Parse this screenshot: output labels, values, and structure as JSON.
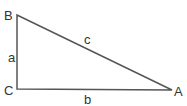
{
  "diagram": {
    "type": "right-triangle",
    "vertices": {
      "B": {
        "label": "B",
        "x": 17,
        "y": 15
      },
      "C": {
        "label": "C",
        "x": 17,
        "y": 89
      },
      "A": {
        "label": "A",
        "x": 172,
        "y": 90
      }
    },
    "sides": {
      "a": {
        "label": "a",
        "from": "B",
        "to": "C"
      },
      "b": {
        "label": "b",
        "from": "C",
        "to": "A"
      },
      "c": {
        "label": "c",
        "from": "B",
        "to": "A"
      }
    },
    "colors": {
      "line": "#555555",
      "text": "#333333",
      "background": "#ffffff"
    }
  }
}
